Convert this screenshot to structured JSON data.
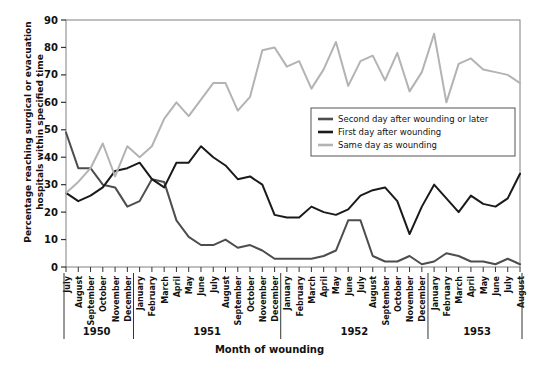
{
  "chart_data": {
    "type": "line",
    "title": "",
    "xlabel": "Month of wounding",
    "ylabel": "Percentage reaching surgical or evacuation hospitals within specified time",
    "ylim": [
      0,
      90
    ],
    "ytick_step": 10,
    "yticks": [
      0,
      10,
      20,
      30,
      40,
      50,
      60,
      70,
      80,
      90
    ],
    "grid": false,
    "legend_position": "inside-right-upper",
    "categories": [
      "July",
      "August",
      "September",
      "October",
      "November",
      "December",
      "January",
      "February",
      "March",
      "April",
      "May",
      "June",
      "July",
      "August",
      "September",
      "October",
      "November",
      "December",
      "January",
      "February",
      "March",
      "April",
      "May",
      "June",
      "July",
      "August",
      "September",
      "October",
      "November",
      "December",
      "January",
      "February",
      "March",
      "April",
      "May",
      "June",
      "July",
      "August"
    ],
    "year_groups": [
      {
        "label": "1950",
        "start_index": 0,
        "count": 6
      },
      {
        "label": "1951",
        "start_index": 6,
        "count": 12
      },
      {
        "label": "1952",
        "start_index": 18,
        "count": 12
      },
      {
        "label": "1953",
        "start_index": 30,
        "count": 8
      }
    ],
    "series": [
      {
        "name": "Second day after wounding or later",
        "color": "#4d4d4d",
        "values": [
          49,
          36,
          36,
          30,
          29,
          22,
          24,
          32,
          31,
          17,
          11,
          8,
          8,
          10,
          7,
          8,
          6,
          3,
          3,
          3,
          3,
          4,
          6,
          17,
          17,
          4,
          2,
          2,
          4,
          1,
          2,
          5,
          4,
          2,
          2,
          1,
          3,
          1
        ]
      },
      {
        "name": "First day after wounding",
        "color": "#1a1a1a",
        "values": [
          27,
          24,
          26,
          29,
          35,
          36,
          38,
          32,
          29,
          38,
          38,
          44,
          40,
          37,
          32,
          33,
          30,
          19,
          18,
          18,
          22,
          20,
          19,
          21,
          26,
          28,
          29,
          24,
          12,
          22,
          30,
          25,
          20,
          26,
          23,
          22,
          25,
          34
        ]
      },
      {
        "name": "Same day as wounding",
        "color": "#b3b3b3",
        "values": [
          27,
          31,
          36,
          45,
          33,
          44,
          40,
          44,
          54,
          60,
          55,
          61,
          67,
          67,
          57,
          62,
          79,
          80,
          73,
          75,
          65,
          72,
          82,
          66,
          75,
          77,
          68,
          78,
          64,
          71,
          85,
          60,
          74,
          76,
          72,
          71,
          70,
          67
        ]
      }
    ]
  },
  "legend": {
    "items": [
      {
        "label": "Second day after wounding or later",
        "color": "#4d4d4d"
      },
      {
        "label": "First day after wounding",
        "color": "#1a1a1a"
      },
      {
        "label": "Same day as wounding",
        "color": "#b3b3b3"
      }
    ]
  }
}
